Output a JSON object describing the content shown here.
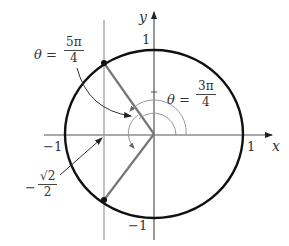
{
  "figure": {
    "axes": {
      "x_label": "x",
      "y_label": "y",
      "x_ticks": [
        {
          "value": -1,
          "label": "−1"
        },
        {
          "value": 1,
          "label": "1"
        }
      ],
      "y_ticks": [
        {
          "value": 1,
          "label": "1"
        },
        {
          "value": -1,
          "label": "−1"
        }
      ]
    },
    "angle_labels": {
      "theta_5pi4": {
        "lhs": "θ =",
        "num": "5π",
        "den": "4"
      },
      "theta_3pi4": {
        "lhs": "θ =",
        "num": "3π",
        "den": "4"
      }
    },
    "x_value_label": {
      "sign": "−",
      "num": "√2",
      "den": "2"
    },
    "points": [
      {
        "name": "upper-point",
        "x": -0.7071,
        "y": 0.7071
      },
      {
        "name": "lower-point",
        "x": -0.7071,
        "y": -0.7071
      }
    ],
    "vertical_line_x": "−√2/2",
    "colors": {
      "circle": "#111111",
      "radius": "#777777",
      "axis": "#555555",
      "arc": "#999999",
      "text": "#333333"
    }
  }
}
